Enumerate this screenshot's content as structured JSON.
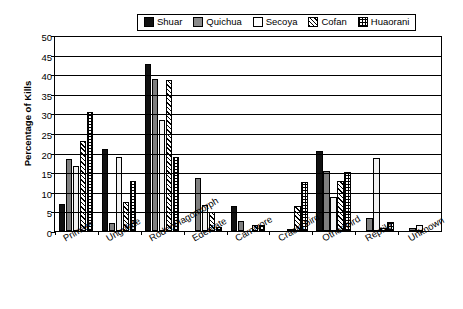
{
  "chart_data": {
    "type": "bar",
    "title": "",
    "xlabel": "",
    "ylabel": "Percentage of Kills",
    "ylim": [
      0,
      50
    ],
    "ytick_step": 5,
    "yticks": [
      0,
      5,
      10,
      15,
      20,
      25,
      30,
      35,
      40,
      45,
      50
    ],
    "grid": true,
    "legend_position": "top-center",
    "categories": [
      "Primate",
      "Ungulate",
      "Rodent/lagomorph",
      "Edentate",
      "Carnivore",
      "Cracid bird",
      "Other bird",
      "Reptile",
      "Unknown"
    ],
    "series": [
      {
        "name": "Shuar",
        "pattern": "solid-black",
        "values": [
          7.0,
          21.0,
          42.5,
          0.0,
          6.5,
          0.0,
          20.5,
          0.0,
          0.0
        ]
      },
      {
        "name": "Quichua",
        "pattern": "dotted-gray",
        "values": [
          18.3,
          2.0,
          38.7,
          13.6,
          2.6,
          0.0,
          15.3,
          3.3,
          0.8
        ]
      },
      {
        "name": "Secoya",
        "pattern": "white",
        "values": [
          16.5,
          18.9,
          28.2,
          6.6,
          0.0,
          0.5,
          8.8,
          18.5,
          1.5
        ]
      },
      {
        "name": "Cofan",
        "pattern": "diagonal-hatch",
        "values": [
          23.0,
          7.5,
          38.5,
          4.8,
          1.5,
          6.3,
          12.8,
          0.7,
          0.0
        ]
      },
      {
        "name": "Huaorani",
        "pattern": "crosshatch",
        "values": [
          30.3,
          12.8,
          19.0,
          1.1,
          1.6,
          12.4,
          15.1,
          2.2,
          0.0
        ]
      }
    ]
  },
  "legend": {
    "items": [
      {
        "label": "Shuar"
      },
      {
        "label": "Quichua"
      },
      {
        "label": "Secoya"
      },
      {
        "label": "Cofan"
      },
      {
        "label": "Huaorani"
      }
    ]
  },
  "axis": {
    "y_title": "Percentage of Kills"
  }
}
